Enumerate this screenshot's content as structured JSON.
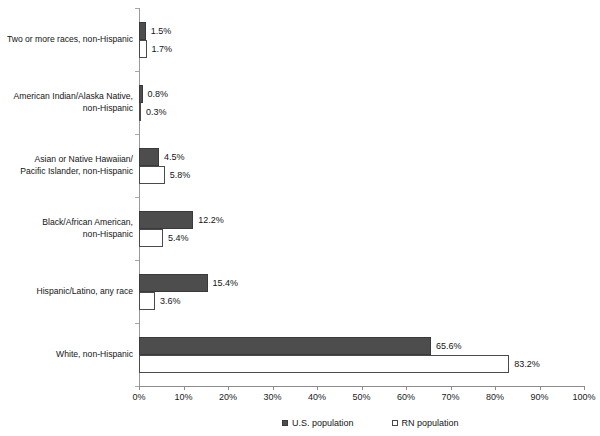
{
  "chart_data": {
    "type": "bar",
    "orientation": "horizontal",
    "title": "",
    "subtitle": "",
    "xlabel": "",
    "ylabel": "",
    "xlim": [
      0,
      100
    ],
    "xtick_labels": [
      "0%",
      "10%",
      "20%",
      "30%",
      "40%",
      "50%",
      "60%",
      "70%",
      "80%",
      "90%",
      "100%"
    ],
    "xtick_values": [
      0,
      10,
      20,
      30,
      40,
      50,
      60,
      70,
      80,
      90,
      100
    ],
    "grid": false,
    "legend_position": "bottom",
    "categories": [
      "Two or more races, non-Hispanic",
      "American Indian/Alaska Native,\nnon-Hispanic",
      "Asian or Native Hawaiian/\nPacific Islander, non-Hispanic",
      "Black/African American,\nnon-Hispanic",
      "Hispanic/Latino, any race",
      "White, non-Hispanic"
    ],
    "series": [
      {
        "name": "U.S. population",
        "color": "#4d4d4d",
        "values": [
          1.5,
          0.8,
          4.5,
          12.2,
          15.4,
          65.6
        ],
        "labels": [
          "1.5%",
          "0.8%",
          "4.5%",
          "12.2%",
          "15.4%",
          "65.6%"
        ]
      },
      {
        "name": "RN population",
        "color": "#ffffff",
        "values": [
          1.7,
          0.3,
          5.8,
          5.4,
          3.6,
          83.2
        ],
        "labels": [
          "1.7%",
          "0.3%",
          "5.8%",
          "5.4%",
          "3.6%",
          "83.2%"
        ]
      }
    ]
  },
  "legend": {
    "items": [
      {
        "label": "U.S. population",
        "marker": "filled-square-icon"
      },
      {
        "label": "RN population",
        "marker": "empty-square-icon"
      }
    ]
  },
  "axis": {
    "x_axis_name": "percent-axis",
    "y_axis_name": "category-axis"
  }
}
